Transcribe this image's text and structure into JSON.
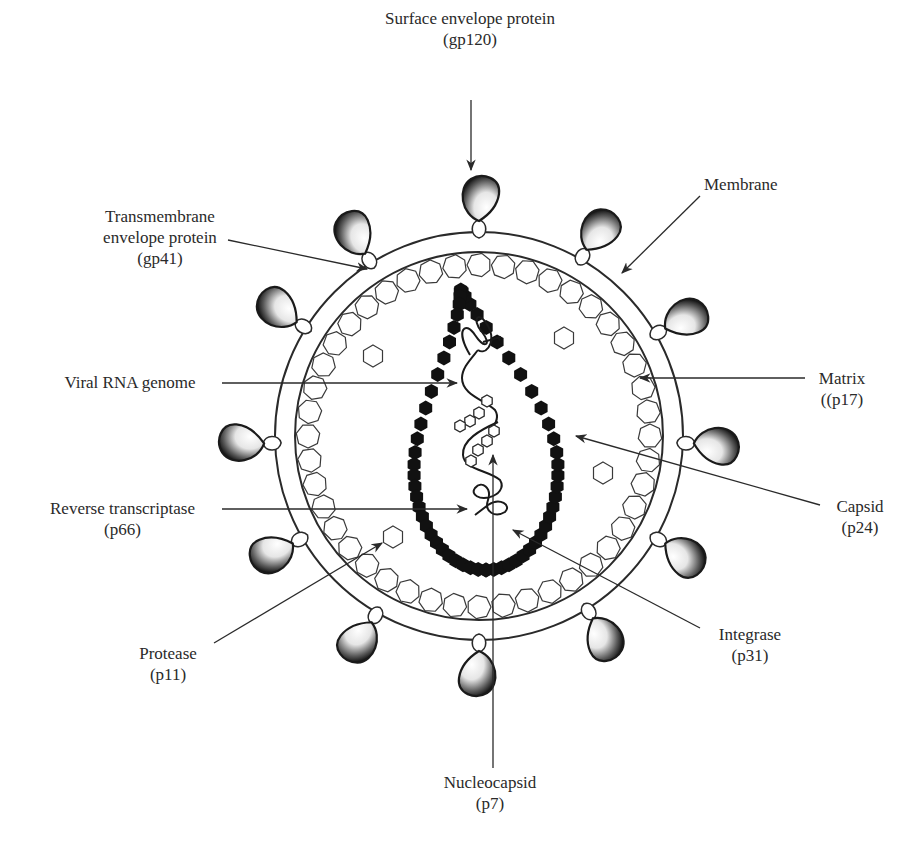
{
  "diagram": {
    "labels": {
      "gp120": {
        "name": "Surface envelope protein",
        "code": "(gp120)"
      },
      "gp41": {
        "line1": "Transmembrane",
        "line2": "envelope protein",
        "code": "(gp41)"
      },
      "membrane": {
        "name": "Membrane"
      },
      "matrix": {
        "name": "Matrix",
        "code": "((p17)"
      },
      "rna": {
        "name": "Viral RNA genome"
      },
      "capsid": {
        "name": "Capsid",
        "code": "(p24)"
      },
      "rt": {
        "name": "Reverse transcriptase",
        "code": "(p66)"
      },
      "protease": {
        "name": "Protease",
        "code": "(p11)"
      },
      "integrase": {
        "name": "Integrase",
        "code": "(p31)"
      },
      "nucleocapsid": {
        "name": "Nucleocapsid",
        "code": "(p7)"
      }
    },
    "colors": {
      "line": "#2a2a2a",
      "capsid_fill": "#111111",
      "spike_dark": "#1a1a1a",
      "spike_light": "#ffffff",
      "background": "#ffffff"
    }
  }
}
